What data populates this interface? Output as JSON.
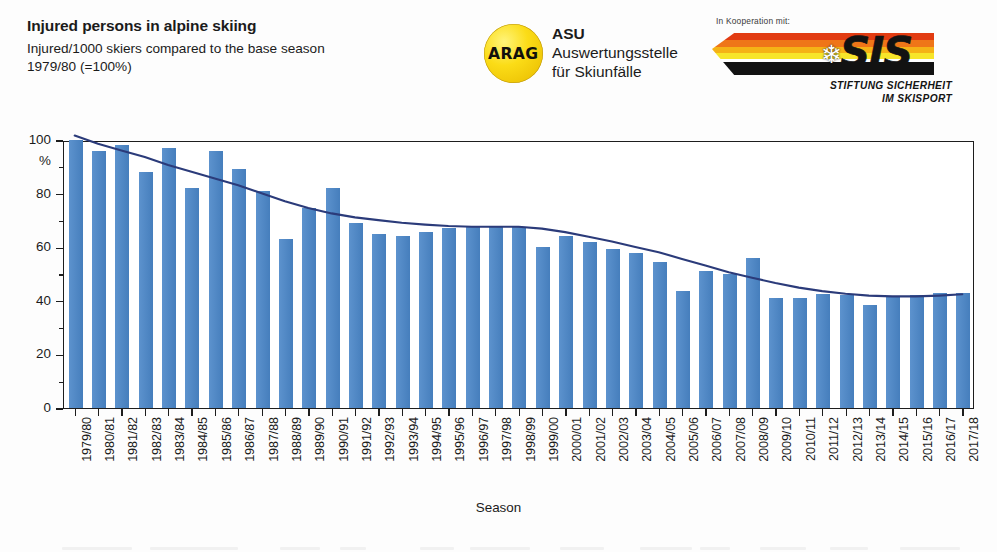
{
  "header": {
    "title": "Injured persons in alpine skiing",
    "subtitle": "Injured/1000 skiers compared to the base season\n1979/80 (=100%)",
    "asu": {
      "badge_text": "ARAG",
      "abbrev": "ASU",
      "line1": "Auswertungsstelle",
      "line2": "für Skiunfälle"
    },
    "sis": {
      "cooperation_note": "In Kooperation mit:",
      "wordmark": "SIS",
      "snowflake_icon": "snowflake-icon",
      "sub_line1": "STIFTUNG SICHERHEIT",
      "sub_line2": "IM SKISPORT"
    }
  },
  "colors": {
    "bar": "#4a86c8",
    "trend": "#2b3b7a",
    "axis": "#1d1d1d",
    "arag_yellow": "#fbdc17",
    "sis_red": "#e23c12",
    "sis_orange": "#ef7518",
    "sis_yellow": "#f7e52a",
    "sis_black": "#121212"
  },
  "chart_data": {
    "type": "bar",
    "title": "Injured persons in alpine skiing",
    "subtitle": "Injured/1000 skiers compared to the base season 1979/80 (=100%)",
    "xlabel": "Season",
    "ylabel": "%",
    "ylim": [
      0,
      100
    ],
    "ytick_labels": [
      "0",
      "20",
      "40",
      "60",
      "80",
      "100"
    ],
    "ytick_values": [
      0,
      20,
      40,
      60,
      80,
      100
    ],
    "yminor_step": 10,
    "grid": false,
    "legend": "none",
    "categories": [
      "1979/80",
      "1980/81",
      "1981/82",
      "1982/83",
      "1983/84",
      "1984/85",
      "1985/86",
      "1986/87",
      "1987/88",
      "1988/89",
      "1989/90",
      "1990/91",
      "1991/92",
      "1992/93",
      "1993/94",
      "1994/95",
      "1995/96",
      "1996/97",
      "1997/98",
      "1998/99",
      "1999/00",
      "2000/01",
      "2001/02",
      "2002/03",
      "2003/04",
      "2004/05",
      "2005/06",
      "2006/07",
      "2007/08",
      "2008/09",
      "2009/10",
      "2010/11",
      "2011/12",
      "2012/13",
      "2013/14",
      "2014/15",
      "2015/16",
      "2016/17",
      "2017/18"
    ],
    "series": [
      {
        "name": "Injured/1000 skiers (index, 1979/80 = 100%)",
        "kind": "bar",
        "values": [
          100,
          96,
          98,
          88,
          97,
          82,
          96,
          89,
          81,
          63,
          74.5,
          82,
          69,
          65,
          64,
          65.5,
          67,
          67.5,
          67.5,
          67.5,
          60,
          64,
          62,
          59.5,
          58,
          54.5,
          43.5,
          51,
          50,
          56,
          41,
          41,
          42.5,
          42,
          38.5,
          41.5,
          42,
          43,
          43
        ]
      },
      {
        "name": "Trend (moving average)",
        "kind": "line",
        "values": [
          102,
          99,
          96.5,
          94,
          91,
          88.5,
          86,
          83.5,
          80.5,
          77.5,
          75,
          73,
          71.5,
          70.5,
          69.5,
          68.8,
          68.3,
          68,
          68,
          68,
          67.3,
          66,
          64.3,
          62.5,
          60.5,
          58.5,
          56,
          53.5,
          51,
          49,
          47,
          45.3,
          44,
          43,
          42.3,
          42,
          42,
          42.3,
          42.8
        ]
      }
    ]
  }
}
